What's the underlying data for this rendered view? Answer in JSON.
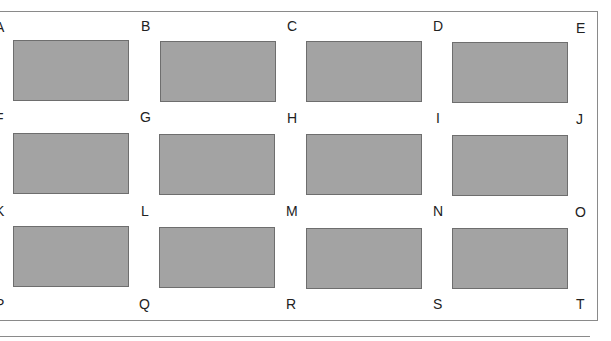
{
  "grid": {
    "row_labels": [
      [
        "A",
        "B",
        "C",
        "D",
        "E"
      ],
      [
        "F",
        "G",
        "H",
        "I",
        "J"
      ],
      [
        "K",
        "L",
        "M",
        "N",
        "O"
      ],
      [
        "P",
        "Q",
        "R",
        "S",
        "T"
      ]
    ],
    "cell_color": "#a3a3a3",
    "cell_border_color": "#6e6e6e"
  }
}
